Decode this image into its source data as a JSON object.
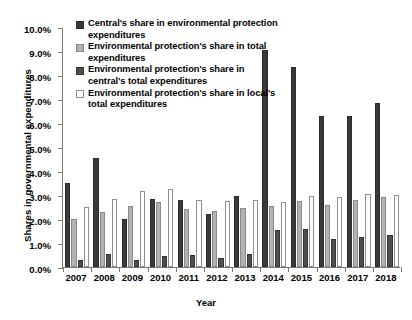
{
  "chart_data": {
    "type": "bar",
    "title": "",
    "xlabel": "Year",
    "ylabel": "Shares in governmental expenditures",
    "categories": [
      "2007",
      "2008",
      "2009",
      "2010",
      "2011",
      "2012",
      "2013",
      "2014",
      "2015",
      "2016",
      "2017",
      "2018"
    ],
    "ylim": [
      0,
      10
    ],
    "ytick_labels": [
      "0.0%",
      "1.0%",
      "2.0%",
      "3.0%",
      "4.0%",
      "5.0%",
      "6.0%",
      "7.0%",
      "8.0%",
      "9.0%",
      "10.0%"
    ],
    "ytick_values": [
      0,
      1,
      2,
      3,
      4,
      5,
      6,
      7,
      8,
      9,
      10
    ],
    "grid": false,
    "legend_position": "top-left-inside",
    "series": [
      {
        "name": "Central's share in environmental protection expenditures",
        "color": "#3a3a3a",
        "values": [
          3.5,
          4.55,
          2.0,
          2.85,
          2.8,
          2.2,
          2.95,
          9.05,
          8.35,
          6.3,
          6.3,
          6.85
        ]
      },
      {
        "name": "Environmental protection's share in total expenditures",
        "color": "#b2b2b2",
        "values": [
          2.0,
          2.3,
          2.55,
          2.7,
          2.4,
          2.35,
          2.45,
          2.55,
          2.75,
          2.6,
          2.8,
          2.9
        ]
      },
      {
        "name": "Environmental protection's share in central's total expenditures",
        "color": "#4f4f4f",
        "values": [
          0.3,
          0.55,
          0.28,
          0.45,
          0.5,
          0.38,
          0.55,
          1.55,
          1.6,
          1.15,
          1.25,
          1.35
        ]
      },
      {
        "name": "Environmental protection's share in local's total expenditures",
        "color": "#ffffff",
        "values": [
          2.5,
          2.85,
          3.15,
          3.25,
          2.8,
          2.75,
          2.8,
          2.7,
          2.95,
          2.9,
          3.05,
          3.0
        ]
      }
    ]
  }
}
